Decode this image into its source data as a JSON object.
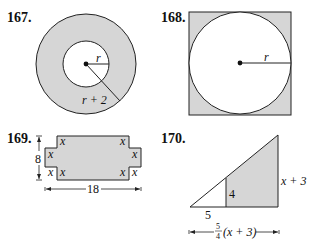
{
  "colors": {
    "shade": "#d6d6d6",
    "stroke": "#222222",
    "background": "#ffffff"
  },
  "figures": [
    {
      "number": "167.",
      "description": "Annulus: shaded ring between two concentric circles",
      "labels": {
        "inner_radius": "r",
        "outer_radius": "r + 2"
      }
    },
    {
      "number": "168.",
      "description": "Circle inscribed in a square, shaded corners",
      "labels": {
        "radius": "r"
      }
    },
    {
      "number": "169.",
      "description": "Rectangle with square notches of side x cut from each corner",
      "labels": {
        "height": "8",
        "width": "18",
        "notch": "x"
      }
    },
    {
      "number": "170.",
      "description": "Right triangle with shaded trapezoid region",
      "labels": {
        "small_base": "5",
        "small_height": "4",
        "large_height": "x + 3",
        "base_frac_num": "5",
        "base_frac_den": "4",
        "base_expr": "(x + 3)"
      }
    }
  ]
}
